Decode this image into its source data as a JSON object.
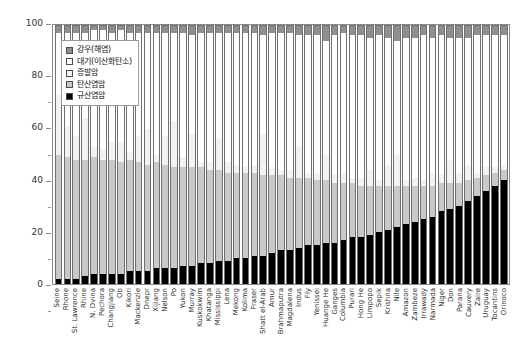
{
  "chart_data": {
    "type": "bar",
    "title": "",
    "subtitle": "",
    "xlabel": "",
    "ylabel": "",
    "ylim": [
      0,
      100
    ],
    "yticks": [
      0,
      20,
      40,
      60,
      80,
      100
    ],
    "yticklabels": [
      "0",
      "20",
      "40",
      "60",
      "80",
      "100"
    ],
    "grid": false,
    "stacked": true,
    "legend_position": "upper-left-inside",
    "legend": [
      {
        "label": "강우(해염)",
        "color": "#8f8f8f",
        "key": "rain"
      },
      {
        "label": "대기(이산화탄소)",
        "color": "#ffffff",
        "key": "atmosphere"
      },
      {
        "label": "증발암",
        "color": "#f2f2f2",
        "key": "evaporite"
      },
      {
        "label": "탄산염암",
        "color": "#c9c9c9",
        "key": "carbonate"
      },
      {
        "label": "규산염암",
        "color": "#000000",
        "key": "silicate"
      }
    ],
    "categories": [
      "Seine",
      "Rhone",
      "St. Lawrence",
      "Rhine",
      "N. Dvina",
      "Pechora",
      "Changjiang",
      "Ob",
      "Kikori",
      "Mackenzie",
      "Dnepr",
      "Xijiang",
      "Nelson",
      "Po",
      "Yukon",
      "Murray",
      "Kuskokwim",
      "Khatanga",
      "Mississippi",
      "Lena",
      "Mekong",
      "Kolima",
      "Fraser",
      "Shatt el-Arab",
      "Amur",
      "Brahmaputra",
      "Magdalena",
      "Indus",
      "Fly",
      "Yenissei",
      "Huange He",
      "Ganges",
      "Columbia",
      "Purari",
      "Hong He",
      "Limpopo",
      "Sepik",
      "Krishna",
      "Nile",
      "Amazon",
      "Zambeze",
      "Irrawady",
      "Narmada",
      "Niger",
      "Don",
      "Parana",
      "Cauvery",
      "Zaire",
      "Uruguay",
      "Tocantins",
      "Orinoco"
    ],
    "series": [
      {
        "name": "규산염암",
        "key": "silicate",
        "color": "#000000",
        "values": [
          2,
          2,
          2,
          3,
          4,
          4,
          4,
          4,
          5,
          5,
          5,
          6,
          6,
          6,
          7,
          7,
          8,
          8,
          9,
          9,
          10,
          10,
          11,
          11,
          12,
          13,
          13,
          14,
          15,
          15,
          16,
          16,
          17,
          18,
          18,
          19,
          20,
          21,
          22,
          23,
          24,
          25,
          26,
          28,
          29,
          30,
          32,
          34,
          36,
          38,
          40
        ]
      },
      {
        "name": "탄산염암",
        "key": "carbonate",
        "color": "#c9c9c9",
        "values": [
          48,
          47,
          46,
          45,
          45,
          44,
          44,
          43,
          43,
          42,
          41,
          41,
          40,
          39,
          38,
          38,
          37,
          36,
          35,
          34,
          33,
          33,
          32,
          31,
          30,
          29,
          28,
          27,
          26,
          25,
          24,
          23,
          22,
          21,
          20,
          19,
          18,
          17,
          16,
          15,
          14,
          13,
          12,
          11,
          10,
          9,
          8,
          7,
          6,
          5,
          4
        ]
      },
      {
        "name": "증발암",
        "key": "evaporite",
        "color": "#f2f2f2",
        "values": [
          23,
          12,
          9,
          16,
          4,
          4,
          7,
          8,
          3,
          10,
          14,
          3,
          11,
          18,
          4,
          13,
          2,
          3,
          12,
          4,
          3,
          2,
          3,
          16,
          3,
          2,
          3,
          12,
          2,
          3,
          10,
          3,
          4,
          2,
          3,
          6,
          2,
          8,
          12,
          2,
          3,
          2,
          5,
          3,
          9,
          4,
          6,
          2,
          3,
          2,
          2
        ]
      },
      {
        "name": "대기(이산화탄소)",
        "key": "atmosphere",
        "color": "#ffffff",
        "values": [
          24,
          36,
          40,
          33,
          45,
          46,
          42,
          43,
          46,
          40,
          37,
          47,
          40,
          34,
          48,
          38,
          50,
          50,
          41,
          50,
          51,
          52,
          51,
          38,
          52,
          53,
          53,
          43,
          53,
          53,
          44,
          54,
          54,
          55,
          55,
          51,
          56,
          49,
          44,
          55,
          54,
          56,
          52,
          54,
          47,
          52,
          49,
          53,
          51,
          51,
          50
        ]
      },
      {
        "name": "강우(해염)",
        "key": "rain",
        "color": "#8f8f8f",
        "values": [
          3,
          3,
          3,
          3,
          2,
          2,
          3,
          2,
          3,
          3,
          3,
          3,
          3,
          3,
          3,
          4,
          3,
          3,
          3,
          3,
          3,
          3,
          3,
          4,
          3,
          3,
          3,
          4,
          4,
          4,
          6,
          4,
          3,
          4,
          4,
          5,
          4,
          5,
          6,
          5,
          5,
          4,
          5,
          4,
          5,
          5,
          5,
          4,
          4,
          4,
          4
        ]
      }
    ]
  }
}
